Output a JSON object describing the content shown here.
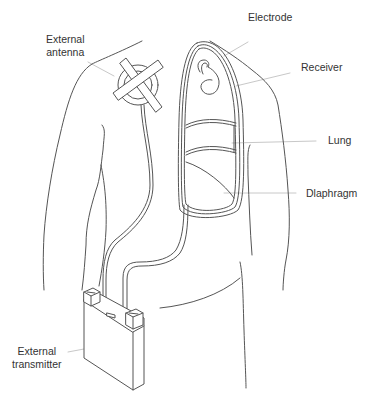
{
  "diagram": {
    "type": "anatomical-illustration",
    "labels": {
      "external_antenna_line1": "External",
      "external_antenna_line2": "antenna",
      "electrode": "Electrode",
      "receiver": "Receiver",
      "lung": "Lung",
      "diaphragm": "Dlaphragm",
      "external_transmitter_line1": "External",
      "external_transmitter_line2": "transmitter"
    },
    "colors": {
      "outline": "#555555",
      "leader_line": "#c8c8c8",
      "text": "#333333",
      "background": "#ffffff"
    }
  }
}
